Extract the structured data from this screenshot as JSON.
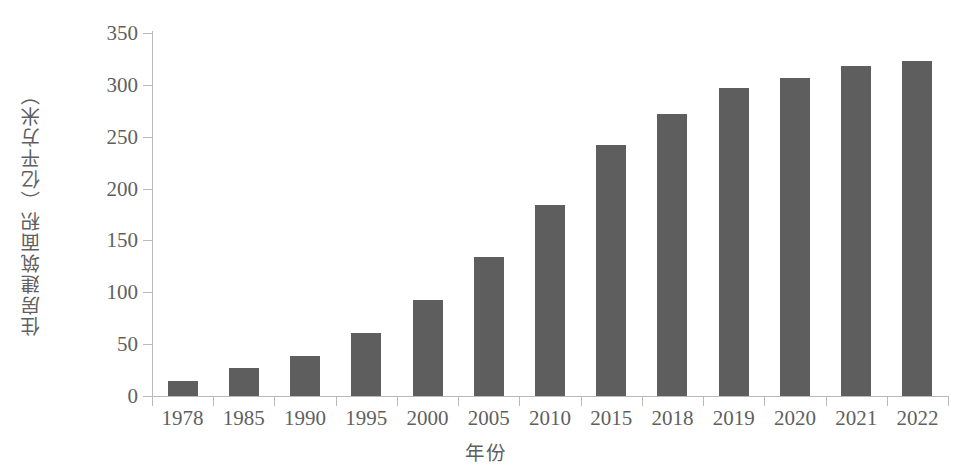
{
  "chart_data": {
    "type": "bar",
    "title": "",
    "xlabel": "年份",
    "ylabel": "住房建筑面积（亿平方米）",
    "categories": [
      "1978",
      "1985",
      "1990",
      "1995",
      "2000",
      "2005",
      "2010",
      "2015",
      "2018",
      "2019",
      "2020",
      "2021",
      "2022"
    ],
    "values": [
      14,
      27,
      39,
      61,
      93,
      134,
      184,
      242,
      272,
      297,
      307,
      318,
      323
    ],
    "ylim": [
      0,
      350
    ],
    "yticks": [
      0,
      50,
      100,
      150,
      200,
      250,
      300,
      350
    ],
    "ytick_labels": [
      "0",
      "50",
      "100",
      "150",
      "200",
      "250",
      "300",
      "350"
    ],
    "grid": false,
    "legend": null,
    "series": [
      {
        "name": "住房建筑面积",
        "values": [
          14,
          27,
          39,
          61,
          93,
          134,
          184,
          242,
          272,
          297,
          307,
          318,
          323
        ]
      }
    ],
    "bar_color": "#5e5e5e",
    "axis_color": "#b9b9b9",
    "text_color": "#5f5f5f",
    "background_color": "#ffffff"
  }
}
